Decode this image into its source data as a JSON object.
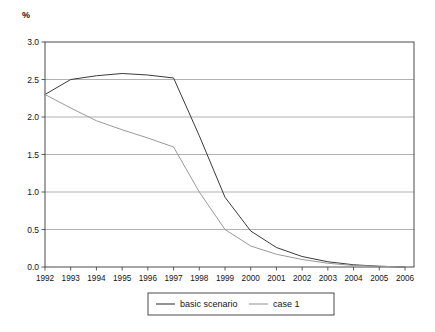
{
  "axis": {
    "unit_label": "%",
    "y_ticks": [
      "3.0",
      "2.5",
      "2.0",
      "1.5",
      "1.0",
      "0.5",
      "0.0"
    ],
    "x_ticks": [
      "1992",
      "1993",
      "1994",
      "1995",
      "1996",
      "1997",
      "1998",
      "1999",
      "2000",
      "2001",
      "2002",
      "2003",
      "2004",
      "2005",
      "2006"
    ]
  },
  "legend": {
    "items": [
      {
        "label": "basic scenario",
        "color": "#3a3a3a"
      },
      {
        "label": "case 1",
        "color": "#9a9a9a"
      }
    ]
  },
  "colors": {
    "basic_scenario": "#3a3a3a",
    "case_1": "#9a9a9a",
    "axis": "#4a4a4a",
    "grid": "#8f8f8f",
    "background": "#ffffff"
  },
  "chart_data": {
    "type": "line",
    "title": "",
    "subtitle": "",
    "xlabel": "",
    "ylabel": "%",
    "ylim": [
      0.0,
      3.0
    ],
    "ytick_step": 0.5,
    "grid": true,
    "legend_position": "bottom",
    "x": [
      1992,
      1993,
      1994,
      1995,
      1996,
      1997,
      1998,
      1999,
      2000,
      2001,
      2002,
      2003,
      2004,
      2005,
      2006
    ],
    "categories": [
      "1992",
      "1993",
      "1994",
      "1995",
      "1996",
      "1997",
      "1998",
      "1999",
      "2000",
      "2001",
      "2002",
      "2003",
      "2004",
      "2005",
      "2006"
    ],
    "series": [
      {
        "name": "basic scenario",
        "color": "#3a3a3a",
        "values": [
          2.3,
          2.5,
          2.55,
          2.58,
          2.56,
          2.52,
          1.75,
          0.93,
          0.48,
          0.26,
          0.14,
          0.07,
          0.03,
          0.01,
          0.0
        ]
      },
      {
        "name": "case 1",
        "color": "#9a9a9a",
        "values": [
          2.3,
          2.12,
          1.95,
          1.83,
          1.72,
          1.6,
          1.0,
          0.5,
          0.28,
          0.17,
          0.1,
          0.05,
          0.02,
          0.01,
          0.0
        ]
      }
    ],
    "annotations": []
  }
}
